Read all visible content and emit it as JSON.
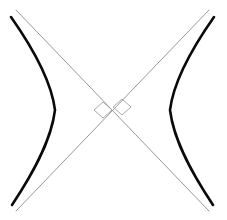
{
  "figure": {
    "background_color": "#ffffff",
    "width": 227,
    "height": 220,
    "center": {
      "x": 112.5,
      "y": 110.5
    }
  },
  "style": {
    "branch_color": "#0a0a0a",
    "branch_width": 2.6,
    "asymptote_color": "#8c8c8c",
    "asymptote_width": 0.9,
    "marker_color": "#a0a0a0",
    "marker_width": 0.9
  },
  "chart_data": {
    "type": "line",
    "xlabel": "",
    "ylabel": "",
    "xlim": [
      -113,
      114
    ],
    "ylim": [
      -110,
      110
    ],
    "grid": false,
    "legend": "none",
    "series": [
      {
        "name": "left-branch",
        "role": "hyperbola-branch",
        "color": "#0a0a0a",
        "path": "M 11,17 C 30,44 51,78 55,110 C 51,143 30,178 12,205"
      },
      {
        "name": "right-branch",
        "role": "hyperbola-branch",
        "color": "#0a0a0a",
        "path": "M 214,17 C 195,44 174,78 170,110 C 174,143 195,178 213,205"
      },
      {
        "name": "asymptote-descending",
        "role": "asymptote",
        "color": "#8c8c8c",
        "x1": 16,
        "y1": 10,
        "x2": 209,
        "y2": 211
      },
      {
        "name": "asymptote-ascending",
        "role": "asymptote",
        "color": "#8c8c8c",
        "x1": 209,
        "y1": 10,
        "x2": 16,
        "y2": 211
      }
    ],
    "annotations": [
      {
        "name": "center-marker-left",
        "shape": "diamond",
        "cx": 103,
        "cy": 110,
        "rx": 9,
        "ry": 8
      },
      {
        "name": "center-marker-right",
        "shape": "diamond",
        "cx": 122,
        "cy": 107,
        "rx": 9,
        "ry": 8
      }
    ]
  }
}
